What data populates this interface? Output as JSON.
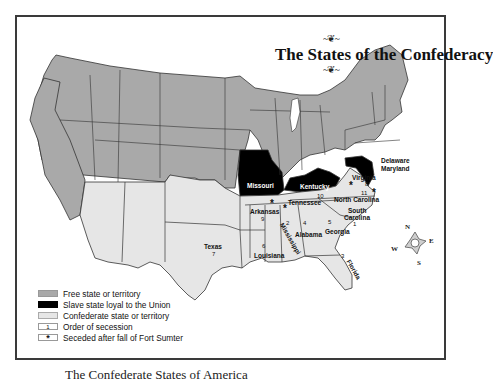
{
  "map": {
    "title": "The States of the Confederacy",
    "colors": {
      "free": "#a9a9a9",
      "slave_union": "#000000",
      "confederate": "#e6e6e6",
      "border": "#333333"
    },
    "state_labels": {
      "missouri": "Missouri",
      "kentucky": "Kentucky",
      "delaware": "Delaware",
      "maryland": "Maryland",
      "virginia": "Virginia",
      "north_carolina": "North Carolina",
      "south_carolina_1": "South",
      "south_carolina_2": "Carolina",
      "tennessee": "Tennessee",
      "arkansas": "Arkansas",
      "texas": "Texas",
      "louisiana": "Louisiana",
      "mississippi": "Mississippi",
      "alabama": "Alabama",
      "georgia": "Georgia",
      "florida": "Florida"
    },
    "secession_order": {
      "south_carolina": "1",
      "mississippi": "2",
      "florida": "3",
      "alabama": "4",
      "georgia": "5",
      "louisiana": "6",
      "texas": "7",
      "virginia": "8",
      "arkansas": "9",
      "tennessee": "10",
      "north_carolina": "11"
    },
    "star_symbol": "*",
    "compass": {
      "n": "N",
      "e": "E",
      "s": "S",
      "w": "W"
    }
  },
  "legend": {
    "items": [
      {
        "key": "free",
        "label": "Free state or territory",
        "symbol": ""
      },
      {
        "key": "slave",
        "label": "Slave state loyal to the Union",
        "symbol": ""
      },
      {
        "key": "conf",
        "label": "Confederate state or territory",
        "symbol": ""
      },
      {
        "key": "num",
        "label": "Order of secession",
        "symbol": "1"
      },
      {
        "key": "star",
        "label": "Seceded after fall of Fort Sumter",
        "symbol": "*"
      }
    ]
  },
  "caption": "The Confederate States of America"
}
